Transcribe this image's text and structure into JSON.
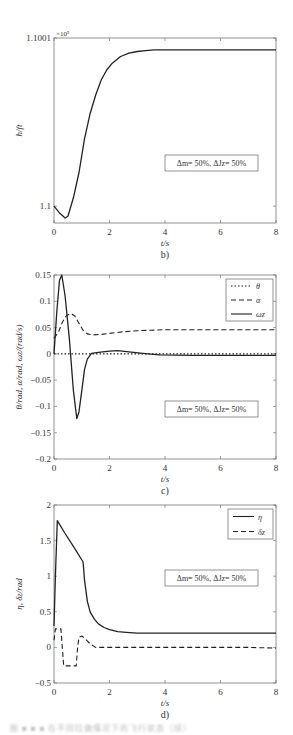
{
  "chart_data": [
    {
      "id": "b",
      "type": "line",
      "panel_label": "b)",
      "xlabel": "t/s",
      "ylabel": "h/ft",
      "y_multiplier": "×10⁵",
      "xlim": [
        0,
        8
      ],
      "ylim": [
        1.09999,
        1.1001
      ],
      "xticks": [
        0,
        2,
        4,
        6,
        8
      ],
      "yticks": [
        {
          "v": 1.1,
          "label": "1.1"
        },
        {
          "v": 1.1001,
          "label": "1.1001"
        }
      ],
      "annotation": "Δm= 50%, ΔJz= 50%",
      "grid": false,
      "series": [
        {
          "name": "h",
          "style": "solid",
          "x": [
            0,
            0.2,
            0.4,
            0.5,
            0.7,
            0.9,
            1.1,
            1.3,
            1.5,
            1.7,
            1.9,
            2.1,
            2.4,
            2.7,
            3.0,
            3.3,
            3.6,
            4.0,
            5,
            6,
            7,
            8
          ],
          "y": [
            1.1,
            1.099996,
            1.099993,
            1.099994,
            1.100005,
            1.10002,
            1.10004,
            1.100055,
            1.100066,
            1.100075,
            1.100081,
            1.100085,
            1.100089,
            1.100091,
            1.100092,
            1.1000925,
            1.100093,
            1.100093,
            1.100093,
            1.100093,
            1.100093,
            1.100093
          ]
        }
      ]
    },
    {
      "id": "c",
      "type": "line",
      "panel_label": "c)",
      "xlabel": "t/s",
      "ylabel": "θ/rad, α/rad, ωz/(rad/s)",
      "xlim": [
        0,
        8
      ],
      "ylim": [
        -0.2,
        0.15
      ],
      "xticks": [
        0,
        2,
        4,
        6,
        8
      ],
      "yticks": [
        {
          "v": 0.15,
          "label": "0.15"
        },
        {
          "v": 0.1,
          "label": "0.1"
        },
        {
          "v": 0.05,
          "label": "0.05"
        },
        {
          "v": 0,
          "label": "0"
        },
        {
          "v": -0.05,
          "label": "-0.05"
        },
        {
          "v": -0.1,
          "label": "-0.1"
        },
        {
          "v": -0.15,
          "label": "-0.15"
        },
        {
          "v": -0.2,
          "label": "-0.2"
        }
      ],
      "annotation": "Δm= 50%, ΔJz= 50%",
      "legend": [
        "θ",
        "α",
        "ωz"
      ],
      "legend_position": "upper right",
      "grid": false,
      "series": [
        {
          "name": "θ",
          "style": "dotted",
          "x": [
            0,
            8
          ],
          "y": [
            0,
            0
          ]
        },
        {
          "name": "α",
          "style": "dashed",
          "x": [
            0,
            0.15,
            0.3,
            0.45,
            0.6,
            0.75,
            0.9,
            1.05,
            1.2,
            1.4,
            1.7,
            2.0,
            2.5,
            3,
            3.5,
            4,
            5,
            6,
            7,
            8
          ],
          "y": [
            0.03,
            0.04,
            0.06,
            0.073,
            0.077,
            0.072,
            0.058,
            0.045,
            0.038,
            0.036,
            0.037,
            0.039,
            0.042,
            0.044,
            0.045,
            0.046,
            0.046,
            0.046,
            0.046,
            0.046
          ]
        },
        {
          "name": "ωz",
          "style": "solid",
          "x": [
            0,
            0.1,
            0.2,
            0.28,
            0.4,
            0.55,
            0.7,
            0.82,
            0.9,
            1.0,
            1.1,
            1.2,
            1.35,
            1.6,
            2.0,
            2.3,
            2.7,
            3.2,
            3.8,
            5,
            6,
            7,
            8
          ],
          "y": [
            0,
            0.08,
            0.14,
            0.15,
            0.11,
            0.03,
            -0.07,
            -0.123,
            -0.11,
            -0.07,
            -0.03,
            -0.01,
            0.001,
            0.003,
            0.005,
            0.006,
            0.004,
            0.001,
            -0.002,
            -0.003,
            -0.003,
            -0.003,
            -0.003
          ]
        }
      ]
    },
    {
      "id": "d",
      "type": "line",
      "panel_label": "d)",
      "xlabel": "t/s",
      "ylabel": "η, δz/rad",
      "xlim": [
        0,
        8
      ],
      "ylim": [
        -0.5,
        2
      ],
      "xticks": [
        0,
        2,
        4,
        6,
        8
      ],
      "yticks": [
        {
          "v": 2,
          "label": "2"
        },
        {
          "v": 1.5,
          "label": "1.5"
        },
        {
          "v": 1,
          "label": "1"
        },
        {
          "v": 0.5,
          "label": "0.5"
        },
        {
          "v": 0,
          "label": "0"
        },
        {
          "v": -0.5,
          "label": "-0.5"
        }
      ],
      "annotation": "Δm= 50%, ΔJz= 50%",
      "legend": [
        "η",
        "δz"
      ],
      "legend_position": "upper right",
      "grid": false,
      "series": [
        {
          "name": "η",
          "style": "solid",
          "x": [
            0,
            0.05,
            0.12,
            0.4,
            0.7,
            1.05,
            1.1,
            1.2,
            1.3,
            1.45,
            1.6,
            1.8,
            2.0,
            2.3,
            2.6,
            3.0,
            4,
            5,
            6,
            7,
            8
          ],
          "y": [
            0.3,
            1.0,
            1.78,
            1.6,
            1.42,
            1.2,
            0.95,
            0.65,
            0.5,
            0.4,
            0.33,
            0.28,
            0.25,
            0.22,
            0.21,
            0.2,
            0.2,
            0.2,
            0.2,
            0.2,
            0.2
          ]
        },
        {
          "name": "δz",
          "style": "dashed",
          "x": [
            0,
            0.05,
            0.25,
            0.3,
            0.35,
            0.8,
            0.85,
            0.9,
            1.0,
            1.1,
            1.3,
            1.5,
            2,
            3,
            4,
            5,
            6,
            7,
            8
          ],
          "y": [
            0.1,
            0.26,
            0.26,
            0.0,
            -0.26,
            -0.26,
            0.0,
            0.14,
            0.16,
            0.13,
            0.05,
            0.0,
            0.0,
            0.0,
            0.0,
            0.0,
            0.0,
            0.0,
            -0.01
          ]
        }
      ]
    }
  ],
  "layout": {
    "panels": [
      {
        "left": 54,
        "right": 276,
        "top": 38,
        "bottom": 223,
        "annot_box": [
          165,
          155,
          93,
          16
        ],
        "legend_box": null
      },
      {
        "left": 54,
        "right": 276,
        "top": 275,
        "bottom": 459,
        "annot_box": [
          165,
          401,
          93,
          16
        ],
        "legend_box": [
          226,
          279,
          47,
          42
        ]
      },
      {
        "left": 54,
        "right": 276,
        "top": 505,
        "bottom": 683,
        "annot_box": [
          165,
          570,
          93,
          16
        ],
        "legend_box": [
          228,
          509,
          45,
          30
        ]
      }
    ]
  },
  "caption_blurred": "图 ■ ■ ■ 在不同拉偏情况下的飞行状态（续）"
}
